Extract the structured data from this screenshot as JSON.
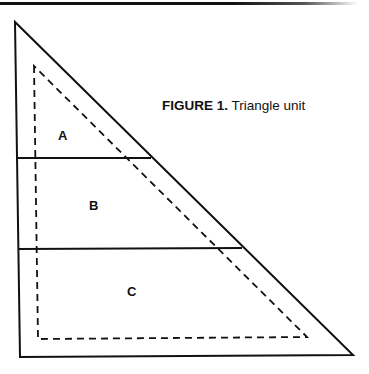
{
  "figure": {
    "caption": {
      "label": "FIGURE 1.",
      "title": "Triangle unit"
    },
    "regions": [
      {
        "id": "A",
        "label": "A"
      },
      {
        "id": "B",
        "label": "B"
      },
      {
        "id": "C",
        "label": "C"
      }
    ],
    "shapes": {
      "outer_triangle": {
        "style": "solid",
        "points": [
          [
            15,
            22
          ],
          [
            20,
            357
          ],
          [
            353,
            355
          ]
        ]
      },
      "inner_triangle": {
        "style": "dashed",
        "points": [
          [
            34,
            66
          ],
          [
            38,
            339
          ],
          [
            307,
            337
          ]
        ]
      },
      "divider_ab": {
        "style": "solid",
        "from": [
          17,
          158
        ],
        "to": [
          151,
          158
        ]
      },
      "divider_bc": {
        "style": "solid",
        "from": [
          18,
          249
        ],
        "to": [
          242,
          248
        ]
      }
    },
    "colors": {
      "line": "#111111",
      "background": "#ffffff"
    }
  }
}
